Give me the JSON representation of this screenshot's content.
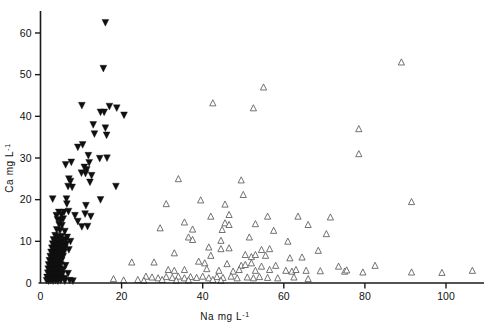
{
  "chart_data": {
    "type": "scatter",
    "title": "",
    "xlabel": "Na  mg L-1",
    "xlabel_base": "Na  mg L",
    "xlabel_exp": "-1",
    "ylabel": "Ca  mg L-1",
    "ylabel_base": "Ca  mg L",
    "ylabel_exp": "-1",
    "xlim": [
      0,
      110
    ],
    "ylim": [
      0,
      65
    ],
    "xticks": [
      0,
      20,
      40,
      60,
      80,
      100
    ],
    "xticklabels": [
      "0",
      "20",
      "40",
      "60",
      "80",
      "100"
    ],
    "yticks": [
      0,
      10,
      20,
      30,
      40,
      50,
      60
    ],
    "yticklabels": [
      "0",
      "10",
      "20",
      "30",
      "40",
      "50",
      "60"
    ],
    "grid": false,
    "legend": "none",
    "axis_color": "#1a1a1a",
    "series": [
      {
        "name": "filled-down-triangle",
        "marker": "triangle-down-filled",
        "color": "#101010",
        "points": [
          [
            16.0,
            62.5
          ],
          [
            15.5,
            51.5
          ],
          [
            10.2,
            42.6
          ],
          [
            17.0,
            42.4
          ],
          [
            18.8,
            42.0
          ],
          [
            14.8,
            41.0
          ],
          [
            15.7,
            41.0
          ],
          [
            20.6,
            40.3
          ],
          [
            13.0,
            38.0
          ],
          [
            16.0,
            37.2
          ],
          [
            13.3,
            35.8
          ],
          [
            16.3,
            35.5
          ],
          [
            9.2,
            32.6
          ],
          [
            10.4,
            33.2
          ],
          [
            11.8,
            30.6
          ],
          [
            16.4,
            30.0
          ],
          [
            7.6,
            29.0
          ],
          [
            12.0,
            28.9
          ],
          [
            14.6,
            29.9
          ],
          [
            6.2,
            28.4
          ],
          [
            10.8,
            27.8
          ],
          [
            11.4,
            27.2
          ],
          [
            10.1,
            26.4
          ],
          [
            11.1,
            26.3
          ],
          [
            12.6,
            25.8
          ],
          [
            7.0,
            25.0
          ],
          [
            7.4,
            24.4
          ],
          [
            12.2,
            24.2
          ],
          [
            6.8,
            23.2
          ],
          [
            7.8,
            23.0
          ],
          [
            18.6,
            23.2
          ],
          [
            3.0,
            20.2
          ],
          [
            6.4,
            20.2
          ],
          [
            14.8,
            20.0
          ],
          [
            6.5,
            19.0
          ],
          [
            11.2,
            18.6
          ],
          [
            4.5,
            17.0
          ],
          [
            5.8,
            17.0
          ],
          [
            6.9,
            17.2
          ],
          [
            11.0,
            16.6
          ],
          [
            3.9,
            16.2
          ],
          [
            5.2,
            16.4
          ],
          [
            8.5,
            16.2
          ],
          [
            12.4,
            16.0
          ],
          [
            4.2,
            15.2
          ],
          [
            5.0,
            15.0
          ],
          [
            5.6,
            15.4
          ],
          [
            9.2,
            14.8
          ],
          [
            4.6,
            14.0
          ],
          [
            5.3,
            13.8
          ],
          [
            10.2,
            13.5
          ],
          [
            11.6,
            13.6
          ],
          [
            4.0,
            12.8
          ],
          [
            4.8,
            12.6
          ],
          [
            6.0,
            12.4
          ],
          [
            3.6,
            11.4
          ],
          [
            4.4,
            11.0
          ],
          [
            5.2,
            11.2
          ],
          [
            6.6,
            11.0
          ],
          [
            3.2,
            10.4
          ],
          [
            3.9,
            10.2
          ],
          [
            4.6,
            10.0
          ],
          [
            5.4,
            10.2
          ],
          [
            6.2,
            10.4
          ],
          [
            7.4,
            10.0
          ],
          [
            3.0,
            9.4
          ],
          [
            3.6,
            9.2
          ],
          [
            4.2,
            9.0
          ],
          [
            4.9,
            9.2
          ],
          [
            5.6,
            9.0
          ],
          [
            6.4,
            9.4
          ],
          [
            2.8,
            8.4
          ],
          [
            3.4,
            8.2
          ],
          [
            4.0,
            8.0
          ],
          [
            4.6,
            8.2
          ],
          [
            5.4,
            8.0
          ],
          [
            6.0,
            8.4
          ],
          [
            7.0,
            8.0
          ],
          [
            2.6,
            7.4
          ],
          [
            3.2,
            7.2
          ],
          [
            3.8,
            7.0
          ],
          [
            4.4,
            7.2
          ],
          [
            5.0,
            7.0
          ],
          [
            5.8,
            7.4
          ],
          [
            2.4,
            6.4
          ],
          [
            3.0,
            6.2
          ],
          [
            3.6,
            6.0
          ],
          [
            4.2,
            6.2
          ],
          [
            4.8,
            6.0
          ],
          [
            5.6,
            6.4
          ],
          [
            2.2,
            5.4
          ],
          [
            2.8,
            5.2
          ],
          [
            3.4,
            5.0
          ],
          [
            4.0,
            5.2
          ],
          [
            4.6,
            5.0
          ],
          [
            5.2,
            5.4
          ],
          [
            2.0,
            4.4
          ],
          [
            2.6,
            4.2
          ],
          [
            3.2,
            4.0
          ],
          [
            3.8,
            4.2
          ],
          [
            4.4,
            4.0
          ],
          [
            5.0,
            4.4
          ],
          [
            6.2,
            4.2
          ],
          [
            1.9,
            3.4
          ],
          [
            2.4,
            3.2
          ],
          [
            3.0,
            3.0
          ],
          [
            3.6,
            3.2
          ],
          [
            4.2,
            3.0
          ],
          [
            4.8,
            3.4
          ],
          [
            5.6,
            3.2
          ],
          [
            1.8,
            2.4
          ],
          [
            2.3,
            2.2
          ],
          [
            2.9,
            2.0
          ],
          [
            3.5,
            2.2
          ],
          [
            4.1,
            2.0
          ],
          [
            4.7,
            2.4
          ],
          [
            5.4,
            2.2
          ],
          [
            6.8,
            2.3
          ],
          [
            1.6,
            1.4
          ],
          [
            2.1,
            1.2
          ],
          [
            2.7,
            1.0
          ],
          [
            3.3,
            1.2
          ],
          [
            3.9,
            1.0
          ],
          [
            4.5,
            1.4
          ],
          [
            5.1,
            1.2
          ],
          [
            5.9,
            1.1
          ],
          [
            1.5,
            0.6
          ],
          [
            2.0,
            0.5
          ],
          [
            2.5,
            0.6
          ],
          [
            3.1,
            0.5
          ],
          [
            3.7,
            0.6
          ],
          [
            4.3,
            0.5
          ],
          [
            5.0,
            0.6
          ],
          [
            6.0,
            0.5
          ],
          [
            7.2,
            0.6
          ],
          [
            8.0,
            0.5
          ]
        ]
      },
      {
        "name": "open-up-triangle",
        "marker": "triangle-up-open",
        "color": "#5a5a5a",
        "points": [
          [
            89.0,
            53.0
          ],
          [
            55.0,
            47.0
          ],
          [
            42.5,
            43.2
          ],
          [
            52.5,
            42.0
          ],
          [
            78.5,
            37.0
          ],
          [
            78.5,
            31.0
          ],
          [
            34.0,
            25.0
          ],
          [
            49.5,
            24.7
          ],
          [
            50.0,
            21.2
          ],
          [
            39.5,
            19.9
          ],
          [
            45.5,
            18.9
          ],
          [
            91.5,
            19.5
          ],
          [
            31.0,
            19.0
          ],
          [
            46.5,
            16.4
          ],
          [
            42.0,
            16.0
          ],
          [
            56.0,
            16.0
          ],
          [
            63.5,
            16.0
          ],
          [
            71.5,
            15.8
          ],
          [
            35.5,
            14.6
          ],
          [
            45.5,
            14.4
          ],
          [
            46.5,
            14.0
          ],
          [
            53.0,
            14.2
          ],
          [
            66.0,
            14.0
          ],
          [
            29.5,
            13.2
          ],
          [
            37.5,
            12.9
          ],
          [
            44.8,
            12.8
          ],
          [
            57.5,
            12.6
          ],
          [
            70.5,
            11.8
          ],
          [
            36.5,
            11.0
          ],
          [
            37.5,
            10.4
          ],
          [
            44.5,
            10.2
          ],
          [
            51.5,
            11.0
          ],
          [
            61.0,
            10.0
          ],
          [
            41.5,
            8.6
          ],
          [
            44.5,
            8.2
          ],
          [
            46.5,
            8.4
          ],
          [
            54.5,
            8.0
          ],
          [
            56.5,
            8.2
          ],
          [
            68.5,
            7.8
          ],
          [
            33.0,
            7.2
          ],
          [
            42.0,
            6.6
          ],
          [
            50.5,
            6.8
          ],
          [
            52.0,
            6.3
          ],
          [
            53.0,
            6.8
          ],
          [
            55.5,
            6.6
          ],
          [
            61.5,
            6.0
          ],
          [
            64.5,
            6.2
          ],
          [
            28.0,
            5.0
          ],
          [
            22.5,
            5.0
          ],
          [
            39.0,
            5.2
          ],
          [
            40.5,
            4.8
          ],
          [
            46.0,
            4.6
          ],
          [
            49.5,
            4.2
          ],
          [
            50.5,
            4.4
          ],
          [
            52.0,
            4.8
          ],
          [
            54.5,
            4.0
          ],
          [
            58.0,
            4.2
          ],
          [
            73.5,
            4.0
          ],
          [
            82.5,
            4.2
          ],
          [
            31.5,
            3.2
          ],
          [
            33.0,
            3.0
          ],
          [
            35.5,
            3.2
          ],
          [
            41.0,
            3.4
          ],
          [
            44.0,
            3.0
          ],
          [
            47.5,
            2.8
          ],
          [
            49.0,
            3.2
          ],
          [
            53.0,
            3.0
          ],
          [
            56.5,
            3.2
          ],
          [
            60.5,
            3.0
          ],
          [
            62.0,
            2.8
          ],
          [
            63.0,
            3.2
          ],
          [
            65.5,
            3.0
          ],
          [
            69.0,
            2.9
          ],
          [
            75.0,
            2.8
          ],
          [
            75.5,
            3.1
          ],
          [
            79.5,
            2.6
          ],
          [
            91.5,
            2.6
          ],
          [
            99.0,
            2.5
          ],
          [
            106.5,
            3.0
          ],
          [
            26.0,
            1.6
          ],
          [
            27.5,
            1.4
          ],
          [
            29.0,
            1.2
          ],
          [
            31.0,
            1.5
          ],
          [
            32.5,
            1.3
          ],
          [
            34.0,
            1.6
          ],
          [
            35.5,
            1.2
          ],
          [
            37.0,
            1.5
          ],
          [
            38.5,
            1.3
          ],
          [
            40.0,
            1.6
          ],
          [
            41.5,
            1.2
          ],
          [
            43.5,
            1.5
          ],
          [
            45.0,
            1.3
          ],
          [
            47.0,
            1.6
          ],
          [
            48.5,
            1.2
          ],
          [
            51.0,
            1.4
          ],
          [
            52.5,
            1.2
          ],
          [
            54.0,
            1.5
          ],
          [
            56.0,
            1.3
          ],
          [
            58.5,
            1.2
          ],
          [
            62.5,
            1.4
          ],
          [
            66.0,
            1.0
          ],
          [
            18.0,
            1.0
          ],
          [
            20.5,
            0.7
          ],
          [
            24.0,
            0.8
          ],
          [
            25.5,
            0.6
          ],
          [
            30.0,
            0.8
          ],
          [
            33.5,
            0.6
          ],
          [
            36.5,
            0.7
          ],
          [
            42.5,
            0.8
          ],
          [
            44.5,
            0.6
          ]
        ]
      }
    ]
  }
}
